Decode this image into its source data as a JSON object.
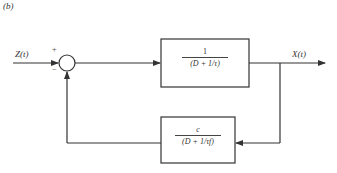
{
  "figure": {
    "panel_label": "(b)",
    "input_signal": "Z(t)",
    "output_signal": "X(t)",
    "summing_junction": {
      "plus_sign": "+",
      "minus_sign": "−"
    },
    "forward_block": {
      "numerator": "1",
      "denominator": "(D + 1/τ)"
    },
    "feedback_block": {
      "numerator": "c",
      "denominator": "(D + 1/τf)"
    },
    "colors": {
      "line": "#333333",
      "background": "#ffffff"
    }
  }
}
